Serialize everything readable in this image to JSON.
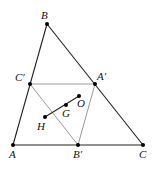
{
  "diagram": {
    "colors": {
      "outer_line": "#222222",
      "medial_line": "#9a9a9a",
      "euler_line": "#222222",
      "point": "#000000",
      "label": "#111111"
    },
    "points": {
      "A": {
        "label": "A",
        "x": 13,
        "y": 145
      },
      "B": {
        "label": "B",
        "x": 47,
        "y": 24
      },
      "C": {
        "label": "C",
        "x": 143,
        "y": 145
      },
      "A1": {
        "label": "A′",
        "x": 95,
        "y": 84
      },
      "B1": {
        "label": "B′",
        "x": 78,
        "y": 145
      },
      "C1": {
        "label": "C′",
        "x": 30,
        "y": 84
      },
      "H": {
        "label": "H",
        "x": 45,
        "y": 117
      },
      "G": {
        "label": "G",
        "x": 66,
        "y": 105
      },
      "O": {
        "label": "O",
        "x": 79,
        "y": 96
      }
    },
    "segments": [
      {
        "from": "A",
        "to": "B",
        "style": "outer"
      },
      {
        "from": "B",
        "to": "C",
        "style": "outer"
      },
      {
        "from": "A",
        "to": "C",
        "style": "outer"
      },
      {
        "from": "C1",
        "to": "A1",
        "style": "medial"
      },
      {
        "from": "C1",
        "to": "B1",
        "style": "medial"
      },
      {
        "from": "A1",
        "to": "B1",
        "style": "medial"
      },
      {
        "from": "H",
        "to": "O",
        "style": "euler"
      }
    ]
  }
}
